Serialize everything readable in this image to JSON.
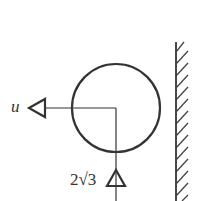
{
  "diagram": {
    "type": "mechanics-free-body",
    "labels": {
      "left_arrow": "u",
      "bottom_arrow": "2√3"
    },
    "elements": {
      "circle": {
        "cx": 116,
        "cy": 108,
        "r": 44
      },
      "wall": {
        "x": 176,
        "y_top": 42,
        "y_bottom": 201,
        "hatch_count": 14
      },
      "horizontal_line": {
        "x1": 44,
        "x2": 116,
        "y": 108
      },
      "vertical_line": {
        "x": 116,
        "y1": 108,
        "y2": 201
      }
    },
    "colors": {
      "stroke": "#333333",
      "background": "#ffffff"
    }
  }
}
